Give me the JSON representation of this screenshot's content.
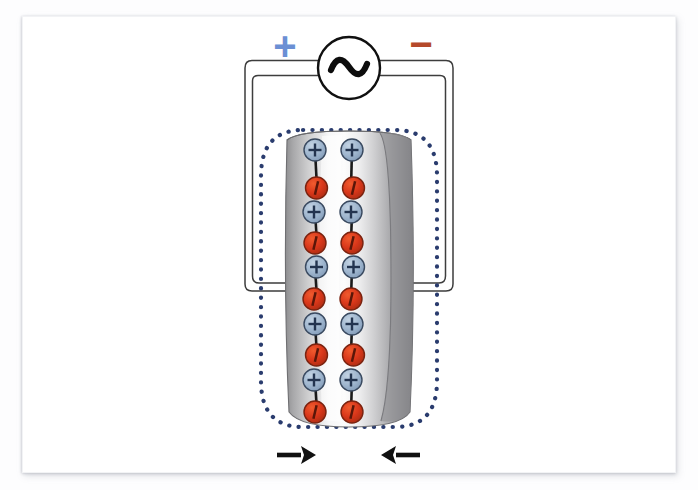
{
  "figure": {
    "type": "physics-schematic"
  },
  "source": {
    "name": "ac-voltage-source",
    "symbol": "~",
    "circle_color": "#ffffff",
    "stroke_color": "#111111",
    "radius": 31,
    "center_x": 349,
    "center_y": 68
  },
  "polarity": {
    "plus": {
      "label": "+",
      "color": "#6b8fd4",
      "x": 279,
      "y": 45
    },
    "minus": {
      "label": "−",
      "color": "#b5492a",
      "x": 421,
      "y": 45
    }
  },
  "wire": {
    "color": "#3c3c3c",
    "fill": "#ffffff",
    "left_x": 245,
    "right_x": 453,
    "top_y": 68,
    "contact_y": 291,
    "tube_left_contact_x": 288,
    "tube_right_contact_x": 410
  },
  "tube": {
    "name": "dielectric-cylinder",
    "center_x": 349,
    "top_y": 132,
    "bottom_y": 424,
    "half_width": 62,
    "gradient": [
      "#9a9a9c",
      "#c9c9ca",
      "#fbfbfb",
      "#efeff0",
      "#b9b9bb",
      "#7e7e80"
    ],
    "edge_color": "#6f6f72"
  },
  "field_outline": {
    "name": "electric-field-boundary",
    "color": "#2a3c6e",
    "style": "dotted",
    "dot_radius": 2.1,
    "left_x": 261,
    "right_x": 437,
    "top_y": 130,
    "bottom_y": 427,
    "corner_radius": 42
  },
  "dipoles": {
    "positive": {
      "label": "+",
      "fill": "#9db4cd",
      "fill_dark": "#7e99b6",
      "stroke": "#3a4a60",
      "glyph_color": "#23344f",
      "radius": 11
    },
    "negative": {
      "label": "−",
      "fill": "#d9371a",
      "fill_dark": "#a82a12",
      "stroke": "#7a2310",
      "glyph_color": "#5a1608",
      "radius": 11
    },
    "bond_color": "#1a1a1a",
    "columns": [
      {
        "name": "dipole-column-left",
        "x": 315,
        "items": [
          {
            "charge": "positive",
            "y": 150
          },
          {
            "charge": "negative",
            "y": 188
          },
          {
            "charge": "positive",
            "y": 212
          },
          {
            "charge": "negative",
            "y": 243
          },
          {
            "charge": "positive",
            "y": 267
          },
          {
            "charge": "negative",
            "y": 299
          },
          {
            "charge": "positive",
            "y": 324
          },
          {
            "charge": "negative",
            "y": 355
          },
          {
            "charge": "positive",
            "y": 380
          },
          {
            "charge": "negative",
            "y": 412
          }
        ]
      },
      {
        "name": "dipole-column-right",
        "x": 352,
        "items": [
          {
            "charge": "positive",
            "y": 150
          },
          {
            "charge": "negative",
            "y": 188
          },
          {
            "charge": "positive",
            "y": 212
          },
          {
            "charge": "negative",
            "y": 243
          },
          {
            "charge": "positive",
            "y": 267
          },
          {
            "charge": "negative",
            "y": 299
          },
          {
            "charge": "positive",
            "y": 324
          },
          {
            "charge": "negative",
            "y": 355
          },
          {
            "charge": "positive",
            "y": 380
          },
          {
            "charge": "negative",
            "y": 412
          }
        ]
      }
    ]
  },
  "arrows": [
    {
      "name": "compression-arrow-left",
      "direction": "right",
      "color": "#111111",
      "tail_x": 277,
      "head_x": 316,
      "y": 455
    },
    {
      "name": "compression-arrow-right",
      "direction": "left",
      "color": "#111111",
      "tail_x": 420,
      "head_x": 381,
      "y": 455
    }
  ]
}
